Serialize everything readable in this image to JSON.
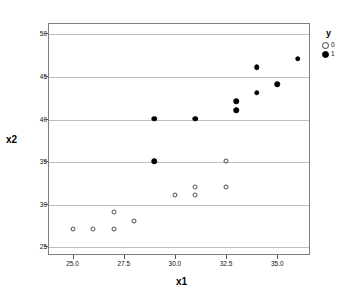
{
  "chart_data": {
    "type": "scatter",
    "title": "",
    "xlabel": "x1",
    "ylabel": "x2",
    "xlim": [
      23.8,
      36.6
    ],
    "ylim": [
      24.0,
      51.2
    ],
    "grid": true,
    "grid_axis": "y",
    "legend": {
      "title": "y",
      "position": "right",
      "entries": [
        {
          "label": "0",
          "marker": "open-circle"
        },
        {
          "label": "1",
          "marker": "filled-circle"
        }
      ]
    },
    "xticks": [
      25.0,
      27.5,
      30.0,
      32.5,
      35.0
    ],
    "xticklabels": [
      "25.0",
      "27.5",
      "30.0",
      "32.5",
      "35.0"
    ],
    "yticks": [
      25,
      30,
      35,
      40,
      45,
      50
    ],
    "yticklabels": [
      "25",
      "30",
      "35",
      "40",
      "45",
      "50"
    ],
    "series": [
      {
        "name": "0",
        "marker": "open-circle",
        "color": "#4d4d4d",
        "points": [
          {
            "x": 25.0,
            "y": 27
          },
          {
            "x": 26.0,
            "y": 27
          },
          {
            "x": 27.0,
            "y": 29
          },
          {
            "x": 27.0,
            "y": 27
          },
          {
            "x": 28.0,
            "y": 28
          },
          {
            "x": 30.0,
            "y": 31
          },
          {
            "x": 31.0,
            "y": 32
          },
          {
            "x": 31.0,
            "y": 31
          },
          {
            "x": 32.5,
            "y": 35
          },
          {
            "x": 32.5,
            "y": 32
          }
        ]
      },
      {
        "name": "1",
        "marker": "filled-circle",
        "color": "#000000",
        "points": [
          {
            "x": 29.0,
            "y": 35
          },
          {
            "x": 29.0,
            "y": 40
          },
          {
            "x": 31.0,
            "y": 40
          },
          {
            "x": 33.0,
            "y": 41
          },
          {
            "x": 33.0,
            "y": 42
          },
          {
            "x": 34.0,
            "y": 43
          },
          {
            "x": 34.0,
            "y": 46
          },
          {
            "x": 35.0,
            "y": 44
          },
          {
            "x": 36.0,
            "y": 47
          }
        ]
      }
    ]
  }
}
